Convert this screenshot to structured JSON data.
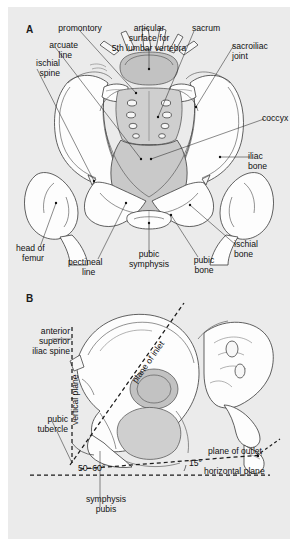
{
  "figure": {
    "background_color": "#ebebeb",
    "page_color": "#ffffff",
    "panels": [
      {
        "letter": "A",
        "view": "superior view of pelvic inlet",
        "labels": [
          "promontory",
          "articular\nsurface for\n5th lumbar vertebra",
          "sacrum",
          "sacroiliac\njoint",
          "arcuate\nline",
          "ischial\nspine",
          "coccyx",
          "iliac\nbone",
          "head of\nfemur",
          "pectineal\nline",
          "pubic\nsymphysis",
          "pubic\nbone",
          "ischial\nbone"
        ]
      },
      {
        "letter": "B",
        "view": "lateral view of pelvis with reference planes",
        "labels": [
          "anterior\nsuperior\niliac spine",
          "vertical plane",
          "pubic\ntubercle",
          "plane of inlet",
          "plane of outlet",
          "horizontal plane",
          "symphysis\npubis"
        ],
        "angles": [
          "50–60°",
          "15°"
        ]
      }
    ]
  },
  "panelA": {
    "letter": "A",
    "promontory": "promontory",
    "articular_surface_l1": "articular",
    "articular_surface_l2": "surface for",
    "articular_surface_l3": "5th lumbar vertebra",
    "sacrum": "sacrum",
    "sacroiliac_l1": "sacroiliac",
    "sacroiliac_l2": "joint",
    "arcuate_l1": "arcuate",
    "arcuate_l2": "line",
    "ischial_spine_l1": "ischial",
    "ischial_spine_l2": "spine",
    "coccyx": "coccyx",
    "iliac_bone_l1": "iliac",
    "iliac_bone_l2": "bone",
    "head_femur_l1": "head of",
    "head_femur_l2": "femur",
    "pectineal_l1": "pectineal",
    "pectineal_l2": "line",
    "pubic_symph_l1": "pubic",
    "pubic_symph_l2": "symphysis",
    "pubic_bone_l1": "pubic",
    "pubic_bone_l2": "bone",
    "ischial_bone_l1": "ischial",
    "ischial_bone_l2": "bone"
  },
  "panelB": {
    "letter": "B",
    "asis_l1": "anterior",
    "asis_l2": "superior",
    "asis_l3": "iliac spine",
    "vertical_plane": "vertical plane",
    "pubic_tubercle_l1": "pubic",
    "pubic_tubercle_l2": "tubercle",
    "plane_of_inlet": "plane of inlet",
    "plane_of_outlet": "plane of outlet",
    "horizontal_plane": "horizontal plane",
    "symphysis_l1": "symphysis",
    "symphysis_l2": "pubis",
    "angle_inlet": "50–60°",
    "angle_outlet": "15°"
  }
}
